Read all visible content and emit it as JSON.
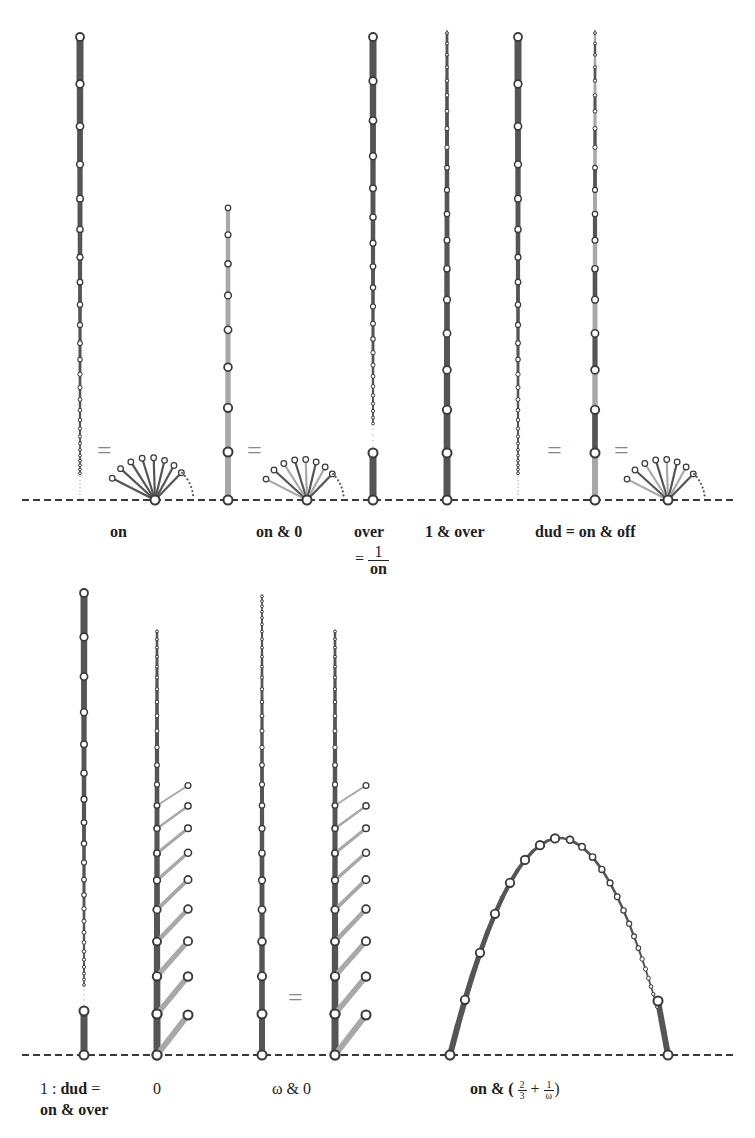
{
  "figure": {
    "colors": {
      "blue_edge": "#555555",
      "red_edge": "#a8a8a8",
      "node_fill": "#ffffff",
      "node_stroke": "#3a3a3a",
      "ground": "#3a3a3a",
      "equals": "#888888"
    },
    "ground_lines": [
      {
        "y": 500,
        "x1": 22,
        "x2": 735
      },
      {
        "y": 1055,
        "x1": 22,
        "x2": 735
      }
    ]
  },
  "top_row": {
    "labels": {
      "on": "on",
      "on_and_zero": "on & 0",
      "over": "over",
      "over_eq": "=",
      "over_num": "1",
      "over_den": "on",
      "one_and_over": "1 & over",
      "dud": "dud = on & off"
    },
    "equals_signs": [
      "=",
      "=",
      "=",
      "="
    ]
  },
  "bottom_row": {
    "labels": {
      "one_colon": "1 : ",
      "dud_bold": "dud",
      "dud_eq": " =",
      "on_and_over": "on & over",
      "zero": "0",
      "omega_and_zero": "ω & 0",
      "on_and_prefix": "on & (",
      "frac1_num": "2",
      "frac1_den": "3",
      "plus": " + ",
      "frac2_num": "1",
      "frac2_den": "ω",
      "close_paren": ")"
    },
    "equals_signs": [
      "="
    ]
  }
}
